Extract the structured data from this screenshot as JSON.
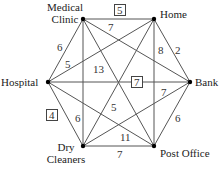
{
  "diagram": {
    "type": "weighted complete graph",
    "nodes": [
      {
        "id": "medical_clinic",
        "label_line1": "Medical",
        "label_line2": "Clinic",
        "x": 83,
        "y": 19
      },
      {
        "id": "home",
        "label": "Home",
        "x": 154,
        "y": 19
      },
      {
        "id": "bank",
        "label": "Bank",
        "x": 190,
        "y": 82
      },
      {
        "id": "post_office",
        "label": "Post Office",
        "x": 154,
        "y": 146
      },
      {
        "id": "dry_cleaners",
        "label_line1": "Dry",
        "label_line2": "Cleaners",
        "x": 83,
        "y": 146
      },
      {
        "id": "hospital",
        "label": "Hospital",
        "x": 48,
        "y": 82
      }
    ],
    "edges": [
      {
        "from": "medical_clinic",
        "to": "home",
        "weight": "5",
        "boxed": true
      },
      {
        "from": "medical_clinic",
        "to": "bank",
        "weight": "7",
        "boxed": false
      },
      {
        "from": "medical_clinic",
        "to": "hospital",
        "weight": "6",
        "boxed": false
      },
      {
        "from": "medical_clinic",
        "to": "post_office",
        "weight": "13",
        "boxed": false
      },
      {
        "from": "medical_clinic",
        "to": "dry_cleaners",
        "weight": "6",
        "boxed": false
      },
      {
        "from": "home",
        "to": "bank",
        "weight": "2",
        "boxed": false
      },
      {
        "from": "home",
        "to": "post_office",
        "weight": "8",
        "boxed": false
      },
      {
        "from": "home",
        "to": "hospital",
        "weight": "5",
        "boxed": false
      },
      {
        "from": "home",
        "to": "dry_cleaners",
        "weight": "5",
        "boxed": false
      },
      {
        "from": "hospital",
        "to": "bank",
        "weight": "7",
        "boxed": true
      },
      {
        "from": "hospital",
        "to": "dry_cleaners",
        "weight": "4",
        "boxed": true
      },
      {
        "from": "hospital",
        "to": "post_office",
        "weight": "11",
        "boxed": false
      },
      {
        "from": "bank",
        "to": "post_office",
        "weight": "6",
        "boxed": false
      },
      {
        "from": "bank",
        "to": "dry_cleaners",
        "weight": "7",
        "boxed": false
      },
      {
        "from": "dry_cleaners",
        "to": "post_office",
        "weight": "7",
        "boxed": false
      }
    ]
  },
  "labels": {
    "medical": "Medical",
    "clinic": "Clinic",
    "home": "Home",
    "bank": "Bank",
    "post_office": "Post Office",
    "dry": "Dry",
    "cleaners": "Cleaners",
    "hospital": "Hospital"
  },
  "weights": {
    "mc_home": "5",
    "mc_bank": "7",
    "mc_hospital": "6",
    "mc_post": "13",
    "mc_dry": "6",
    "home_bank": "2",
    "home_post": "8",
    "home_hospital": "5",
    "home_dry": "5",
    "hospital_bank": "7",
    "hospital_dry": "4",
    "hospital_post": "11",
    "bank_post": "6",
    "bank_dry": "7",
    "dry_post": "7"
  }
}
